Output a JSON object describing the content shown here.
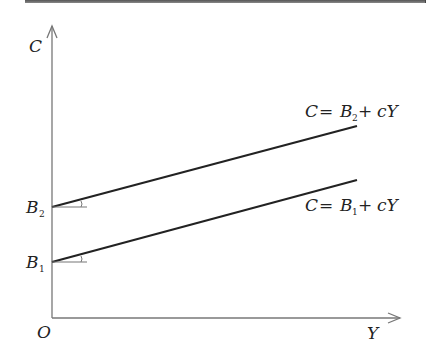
{
  "diagram": {
    "type": "consumption-function",
    "axes": {
      "y_label": "C",
      "x_label": "Y",
      "origin_label": "O"
    },
    "intercepts": [
      {
        "label": "B",
        "subscript": "2"
      },
      {
        "label": "B",
        "subscript": "1"
      }
    ],
    "lines": [
      {
        "lhs": "C",
        "eq": "=",
        "intercept": "B",
        "subscript": "2",
        "plus": "+",
        "slope_term": "cY"
      },
      {
        "lhs": "C",
        "eq": "=",
        "intercept": "B",
        "subscript": "1",
        "plus": "+",
        "slope_term": "cY"
      }
    ],
    "colors": {
      "axis": "#777777",
      "line": "#222222",
      "text": "#222222"
    }
  }
}
